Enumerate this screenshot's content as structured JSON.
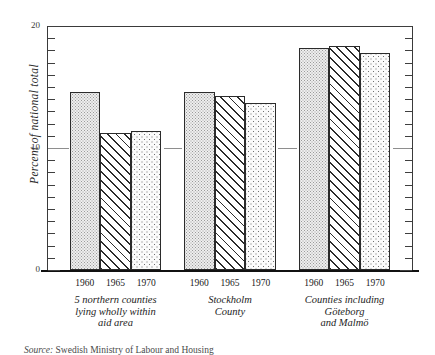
{
  "chart_data": {
    "type": "bar",
    "title": "",
    "subtitle": "",
    "xlabel": "",
    "ylabel": "Percent of national total",
    "ylim": [
      0,
      20
    ],
    "y_major_ticks": [
      0,
      10,
      20
    ],
    "y_major_tick_labels": [
      "0",
      "10",
      "20"
    ],
    "y_minor_tick_step": 1,
    "grid": "partial-value-10-stubs",
    "legend": "none",
    "categories": [
      "1960",
      "1965",
      "1970"
    ],
    "groups": [
      {
        "name": "5 northern counties lying wholly within aid area",
        "caption_lines": [
          "5 northern counties",
          "lying wholly within",
          "aid area"
        ],
        "values": [
          14.6,
          11.2,
          11.4
        ]
      },
      {
        "name": "Stockholm County",
        "caption_lines": [
          "Stockholm",
          "County"
        ],
        "values": [
          14.6,
          14.3,
          13.7
        ]
      },
      {
        "name": "Counties including Göteborg and Malmö",
        "caption_lines": [
          "Counties including",
          "Göteborg",
          "and Malmö"
        ],
        "values": [
          18.2,
          18.4,
          17.8
        ]
      }
    ],
    "series": [
      {
        "name": "1960",
        "values": [
          14.6,
          14.6,
          18.2
        ],
        "fill": "fine-dot-stipple"
      },
      {
        "name": "1965",
        "values": [
          11.2,
          14.3,
          18.4
        ],
        "fill": "diagonal-hatch"
      },
      {
        "name": "1970",
        "values": [
          11.4,
          13.7,
          17.8
        ],
        "fill": "coarse-dot-stipple"
      }
    ]
  },
  "axis": {
    "y_label": "Percent of national total",
    "y_tick_top": "20",
    "y_tick_mid": "10",
    "y_tick_bottom": "0"
  },
  "year_labels": [
    "1960",
    "1965",
    "1970"
  ],
  "captions": {
    "group1": [
      "5 northern counties",
      "lying wholly within",
      "aid area"
    ],
    "group2": [
      "Stockholm",
      "County"
    ],
    "group3": [
      "Counties including",
      "Göteborg",
      "and Malmö"
    ]
  },
  "source_note": {
    "label": "Source:",
    "text": "Swedish Ministry of Labour and Housing"
  },
  "colors": {
    "ink": "#1a1a1a",
    "axis": "#3a3a3a",
    "baseline": "#111111",
    "grid": "#8e8e8e",
    "bar_outline": "#2b2b2b",
    "stipple_light": "#eeeeee",
    "stipple_dot": "#9a9a9a",
    "hatch_line": "#2b2b2b",
    "paper": "#ffffff"
  }
}
